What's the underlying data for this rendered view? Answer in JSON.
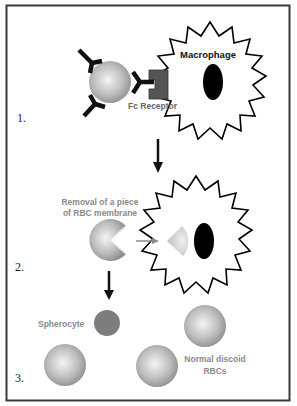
{
  "figure": {
    "steps": [
      {
        "number": "1.",
        "labels": {
          "macrophage": "Macrophage",
          "fc_receptor": "Fc Receptor"
        }
      },
      {
        "number": "2.",
        "labels": {
          "removal_line1": "Removal of a piece",
          "removal_line2": "of RBC membrane"
        }
      },
      {
        "number": "3.",
        "labels": {
          "spherocyte": "Spherocyte",
          "normal_line1": "Normal discoid",
          "normal_line2": "RBCs"
        }
      }
    ],
    "colors": {
      "border": "#3a3a3a",
      "rbc_edge": "#8c8c8c",
      "rbc_center": "#f2f2f2",
      "spherocyte": "#7d7d7d",
      "fc_receptor": "#555555",
      "antibody": "#111111",
      "nucleus": "#000000",
      "gray_text": "#8a8a8a",
      "arrow": "#111111",
      "gray_arrow": "#8a8a8a"
    }
  }
}
